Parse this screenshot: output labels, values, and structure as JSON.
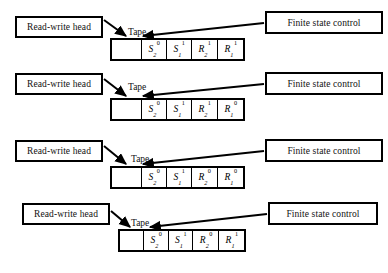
{
  "figure": {
    "type": "turing-machine-configuration-sequence",
    "row_count": 4,
    "caption_label": "Tape",
    "left_box_label": "Read-write head",
    "right_box_label": "Finite state control",
    "colors": {
      "stroke": "#000000",
      "background": "#ffffff",
      "text": "#111111"
    }
  },
  "rows": [
    {
      "id": "row-1",
      "left_label": "Read-write head",
      "right_label": "Finite state control",
      "tape_label": "Tape",
      "cells": [
        {
          "base": "",
          "sub": "",
          "sup": ""
        },
        {
          "base": "S",
          "sub": "2",
          "sup": "0"
        },
        {
          "base": "S",
          "sub": "1",
          "sup": "1"
        },
        {
          "base": "R",
          "sub": "2",
          "sup": "1"
        },
        {
          "base": "R",
          "sub": "1",
          "sup": "1"
        }
      ]
    },
    {
      "id": "row-2",
      "left_label": "Read-write head",
      "right_label": "Finite state control",
      "tape_label": "Tape",
      "cells": [
        {
          "base": "",
          "sub": "",
          "sup": ""
        },
        {
          "base": "S",
          "sub": "2",
          "sup": "0"
        },
        {
          "base": "S",
          "sub": "1",
          "sup": "1"
        },
        {
          "base": "R",
          "sub": "2",
          "sup": "1"
        },
        {
          "base": "R",
          "sub": "1",
          "sup": "0"
        }
      ]
    },
    {
      "id": "row-3",
      "left_label": "Read-write head",
      "right_label": "Finite state control",
      "tape_label": "Tape",
      "cells": [
        {
          "base": "",
          "sub": "",
          "sup": ""
        },
        {
          "base": "S",
          "sub": "2",
          "sup": "0"
        },
        {
          "base": "S",
          "sub": "1",
          "sup": "1"
        },
        {
          "base": "R",
          "sub": "2",
          "sup": "0"
        },
        {
          "base": "R",
          "sub": "1",
          "sup": "0"
        }
      ]
    },
    {
      "id": "row-4",
      "left_label": "Read-write head",
      "right_label": "Finite state control",
      "tape_label": "Tape",
      "cells": [
        {
          "base": "",
          "sub": "",
          "sup": ""
        },
        {
          "base": "S",
          "sub": "2",
          "sup": "0"
        },
        {
          "base": "S",
          "sub": "1",
          "sup": "1"
        },
        {
          "base": "R",
          "sub": "2",
          "sup": "0"
        },
        {
          "base": "R",
          "sub": "1",
          "sup": "1"
        }
      ]
    }
  ]
}
